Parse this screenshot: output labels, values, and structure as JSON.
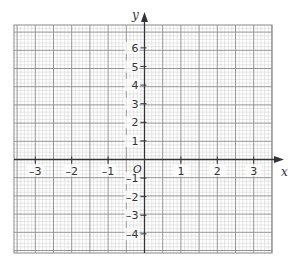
{
  "diagram": {
    "type": "coordinate-grid",
    "x_axis": {
      "label": "x",
      "min": -3.5,
      "max": 3.5,
      "tick_labels": [
        "-3",
        "-2",
        "-1",
        "1",
        "2",
        "3"
      ],
      "tick_values": [
        -3,
        -2,
        -1,
        1,
        2,
        3
      ]
    },
    "y_axis": {
      "label": "y",
      "min": -5,
      "max": 7,
      "tick_labels": [
        "6",
        "5",
        "4",
        "3",
        "2",
        "1",
        "-1",
        "-2",
        "-3",
        "-4"
      ],
      "tick_values": [
        6,
        5,
        4,
        3,
        2,
        1,
        -1,
        -2,
        -3,
        -4
      ]
    },
    "origin_label": "O",
    "grid": {
      "major_color": "#8a8a8a",
      "minor_color": "#cfcfcf",
      "axis_color": "#333333",
      "minor_subdivisions": 5
    }
  }
}
